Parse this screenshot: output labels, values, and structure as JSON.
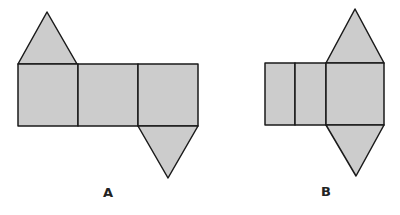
{
  "figures": [
    {
      "label": "A",
      "description": "Net of a triangular prism: three rectangles in a row with a triangle on top of the left rectangle and a triangle below the right rectangle"
    },
    {
      "label": "B",
      "description": "Net: two narrow rectangles and one square with triangles on top and bottom of the square"
    }
  ],
  "colors": {
    "fill": "#cccccc",
    "stroke": "#1a1a1a"
  }
}
